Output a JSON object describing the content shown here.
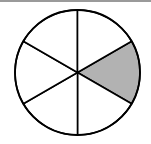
{
  "figure": {
    "type": "fraction-circle",
    "total_sectors": 6,
    "shaded_sectors": 1,
    "shaded_fraction": "1/6",
    "center": [
      77.5,
      72.5
    ],
    "radius": 62.5,
    "colors": {
      "stroke": "#000000",
      "shaded_fill": "#b2b2b2",
      "unshaded_fill": "#ffffff",
      "top_bar": "#9a9a9a"
    },
    "sectors": [
      {
        "index": 0,
        "start_deg": -30,
        "end_deg": 30,
        "shaded": true
      },
      {
        "index": 1,
        "start_deg": 30,
        "end_deg": 90,
        "shaded": false
      },
      {
        "index": 2,
        "start_deg": 90,
        "end_deg": 150,
        "shaded": false
      },
      {
        "index": 3,
        "start_deg": 150,
        "end_deg": 210,
        "shaded": false
      },
      {
        "index": 4,
        "start_deg": 210,
        "end_deg": 270,
        "shaded": false
      },
      {
        "index": 5,
        "start_deg": 270,
        "end_deg": 330,
        "shaded": false
      }
    ]
  }
}
